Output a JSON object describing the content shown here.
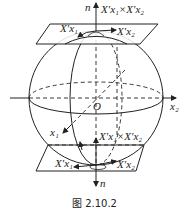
{
  "figure": {
    "caption": "图 2.10.2",
    "labels": {
      "n_top": "n",
      "n_bottom": "n",
      "cross_top": "X′x₁×X′x₂",
      "cross_bottom": "X′x₁×X′x₂",
      "tangent1_top": "X′x₁",
      "tangent2_top": "X′x₂",
      "tangent1_bottom": "X′x₁",
      "tangent2_bottom": "X′x₂",
      "origin": "O",
      "axis_x1": "x₁",
      "axis_x2": "x₂"
    },
    "stroke_color": "#222222",
    "background": "#ffffff"
  }
}
